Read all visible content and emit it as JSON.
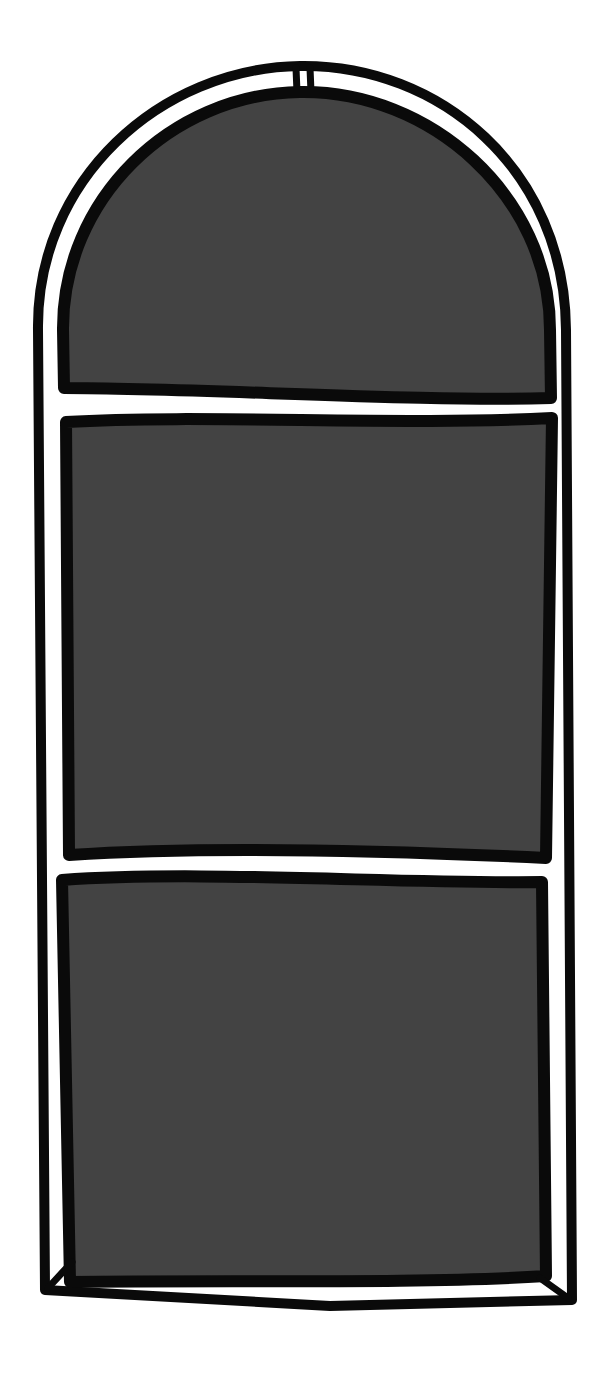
{
  "illustration": {
    "subject": "arched window",
    "pane_count": 3,
    "colors": {
      "background": "#ffffff",
      "frame_stroke": "#0a0a0a",
      "frame_fill": "#ffffff",
      "pane_fill": "#434343"
    },
    "panes": [
      {
        "label": "arch-top-pane"
      },
      {
        "label": "middle-pane"
      },
      {
        "label": "bottom-pane"
      }
    ]
  }
}
